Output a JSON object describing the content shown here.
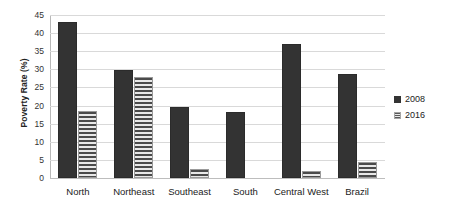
{
  "chart_data": {
    "type": "bar",
    "title": "",
    "xlabel": "",
    "ylabel": "Poverty Rate (%)",
    "ylim": [
      0,
      45
    ],
    "ytick_step": 5,
    "yticks": [
      45,
      40,
      35,
      30,
      25,
      20,
      15,
      10,
      5,
      0
    ],
    "grid": true,
    "legend_position": "right",
    "categories": [
      "North",
      "Northeast",
      "Southeast",
      "South",
      "Central West",
      "Brazil"
    ],
    "series": [
      {
        "name": "2008",
        "fill": "solid",
        "color": "#333333",
        "values": [
          43,
          29.8,
          19.6,
          18.2,
          37,
          28.8
        ]
      },
      {
        "name": "2016",
        "fill": "horizontal-stripes",
        "color": "#4a4a4a",
        "values": [
          18.6,
          28,
          2.5,
          0,
          1.8,
          4.3
        ]
      }
    ]
  },
  "axis": {
    "y_title": "Poverty Rate (%)"
  },
  "legend": {
    "items": [
      {
        "label": "2008",
        "swatch": "solid-dark-square-icon"
      },
      {
        "label": "2016",
        "swatch": "striped-gray-square-icon"
      }
    ]
  },
  "colors": {
    "series_2008": "#333333",
    "series_2016": "#4a4a4a",
    "gridline": "#d9d9d9",
    "axis": "#b8b8b8",
    "background": "#ffffff",
    "text": "#222222"
  }
}
